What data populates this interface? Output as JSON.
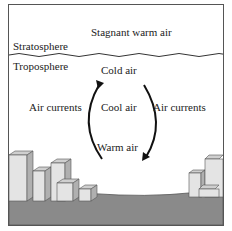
{
  "diagram": {
    "labels": {
      "stagnant": "Stagnant warm air",
      "stratosphere": "Stratosphere",
      "troposphere": "Troposphere",
      "cold_air": "Cold air",
      "cool_air": "Cool air",
      "warm_air": "Warm air",
      "air_currents_left": "Air currents",
      "air_currents_right": "Air currents"
    },
    "colors": {
      "ground": "#8a8a8a",
      "building_front": "#e4e4e4",
      "building_side": "#b0b0b0",
      "line": "#222222"
    }
  }
}
